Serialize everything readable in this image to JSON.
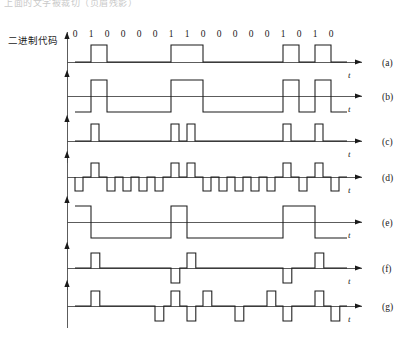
{
  "figure": {
    "top_cut_text": "上面的文字被裁切（页眉残影）",
    "code_label": "二进制代码",
    "bits": [
      "0",
      "1",
      "0",
      "0",
      "0",
      "0",
      "1",
      "1",
      "0",
      "0",
      "0",
      "0",
      "0",
      "1",
      "0",
      "1",
      "0"
    ],
    "bit_count": 17,
    "axis_symbol": "t",
    "colors": {
      "ink": "#1a1a1a",
      "axis": "#4a4a4a",
      "background": "#ffffff",
      "ghost_text": "#c9c9c9"
    },
    "geometry": {
      "origin_x": 75,
      "bit_width": 16.0,
      "plot_right": 352,
      "arrow_tip_x": 362
    },
    "rows": [
      {
        "letter": "(a)",
        "name": "unipolar-nrz",
        "baseline_y": 62,
        "amplitude": 17,
        "letter_y": 58,
        "axis_label_y": 70,
        "axis_label_x": 348
      },
      {
        "letter": "(b)",
        "name": "bipolar-nrz",
        "baseline_y": 96,
        "amplitude": 16,
        "letter_y": 92,
        "axis_label_y": 104,
        "axis_label_x": 348
      },
      {
        "letter": "(c)",
        "name": "unipolar-rz",
        "baseline_y": 141,
        "amplitude": 17,
        "letter_y": 137,
        "axis_label_y": 149,
        "axis_label_x": 348
      },
      {
        "letter": "(d)",
        "name": "bipolar-rz",
        "baseline_y": 177,
        "amplitude": 14,
        "letter_y": 173,
        "axis_label_y": 185,
        "axis_label_x": 348
      },
      {
        "letter": "(e)",
        "name": "differential-nrz-i",
        "baseline_y": 222,
        "amplitude": 16,
        "letter_y": 218,
        "axis_label_y": 230,
        "axis_label_x": 348
      },
      {
        "letter": "(f)",
        "name": "ami-alternate-mark-inversion",
        "baseline_y": 268,
        "amplitude": 15,
        "letter_y": 264,
        "axis_label_y": 276,
        "axis_label_x": 348
      },
      {
        "letter": "(g)",
        "name": "hdb3",
        "baseline_y": 306,
        "amplitude": 15,
        "letter_y": 302,
        "axis_label_y": 314,
        "axis_label_x": 348
      }
    ],
    "waveform_levels": {
      "unipolar_nrz": [
        0,
        1,
        0,
        0,
        0,
        0,
        1,
        1,
        0,
        0,
        0,
        0,
        0,
        1,
        0,
        1,
        0
      ],
      "bipolar_nrz": [
        -1,
        1,
        -1,
        -1,
        -1,
        -1,
        1,
        1,
        -1,
        -1,
        -1,
        -1,
        -1,
        1,
        -1,
        1,
        -1
      ],
      "unipolar_rz": [
        0,
        1,
        0,
        0,
        0,
        0,
        1,
        1,
        0,
        0,
        0,
        0,
        0,
        1,
        0,
        1,
        0
      ],
      "bipolar_rz": [
        -1,
        1,
        -1,
        -1,
        -1,
        -1,
        1,
        1,
        -1,
        -1,
        -1,
        -1,
        -1,
        1,
        -1,
        1,
        -1
      ],
      "differential_nrz_i": [
        1,
        -1,
        -1,
        -1,
        -1,
        -1,
        1,
        -1,
        -1,
        -1,
        -1,
        -1,
        -1,
        1,
        1,
        -1,
        -1
      ],
      "ami": [
        0,
        1,
        0,
        0,
        0,
        0,
        -1,
        1,
        0,
        0,
        0,
        0,
        0,
        -1,
        0,
        1,
        0
      ],
      "hdb3": [
        0,
        1,
        0,
        0,
        0,
        -1,
        1,
        -1,
        1,
        0,
        -1,
        0,
        1,
        -1,
        0,
        1,
        -1
      ]
    }
  }
}
